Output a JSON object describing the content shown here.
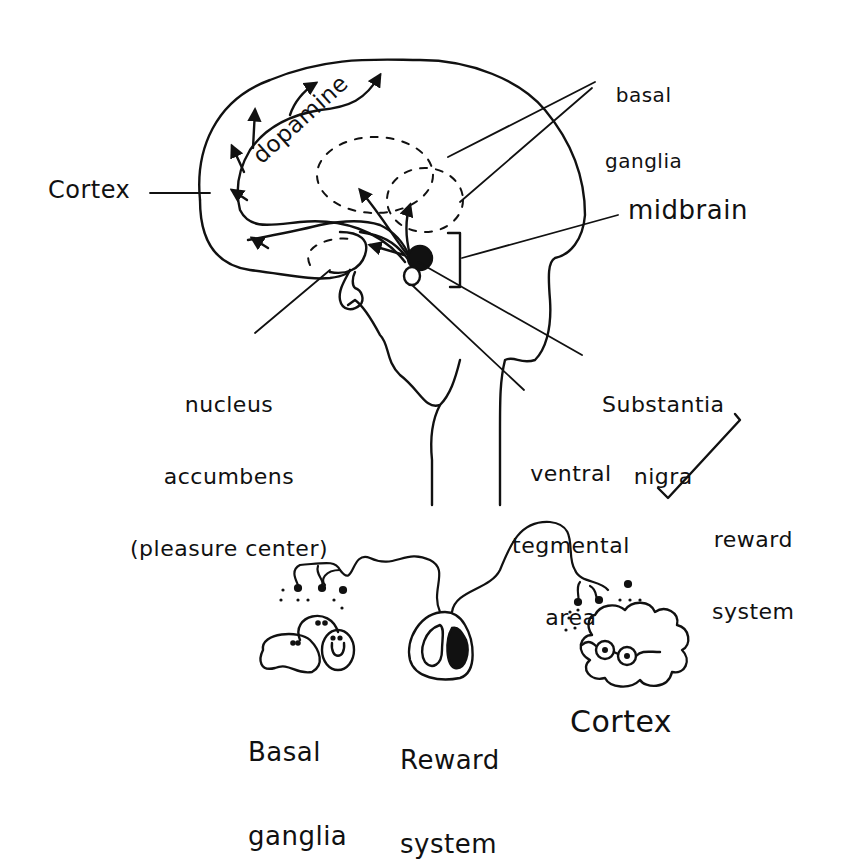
{
  "diagram": {
    "top_brain": {
      "labels": {
        "cortex": "Cortex",
        "dopamine": "dopamine",
        "basal_ganglia_1": "basal",
        "basal_ganglia_2": "ganglia",
        "midbrain": "midbrain",
        "nucleus_1": "nucleus",
        "nucleus_2": "accumbens",
        "nucleus_3": "(pleasure center)",
        "substantia_1": "Substantia",
        "substantia_2": "nigra",
        "vta_1": "ventral",
        "vta_2": "tegmental",
        "vta_3": "area",
        "reward_1": "reward",
        "reward_2": "system"
      }
    },
    "bottom_cartoon": {
      "basal_ganglia_1": "Basal",
      "basal_ganglia_2": "ganglia",
      "reward_1": "Reward",
      "reward_2": "system",
      "cortex": "Cortex"
    },
    "colors": {
      "ink": "#111111",
      "paper": "#ffffff"
    }
  }
}
